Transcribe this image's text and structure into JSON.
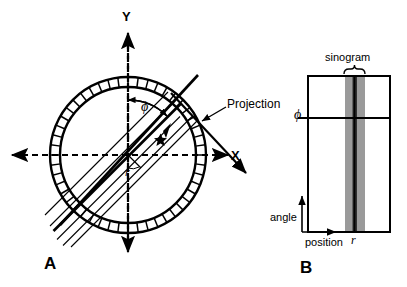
{
  "figure": {
    "background_color": "#ffffff",
    "stroke_color": "#000000",
    "width": 407,
    "height": 287
  },
  "panel_a": {
    "label": "A",
    "axis_y_label": "Y",
    "axis_x_label": "X",
    "angle_label": "ϕ",
    "radius_label": "r",
    "projection_label": "Projection",
    "detector_ring": {
      "segment_count": 48,
      "outer_radius": 78,
      "inner_radius": 68,
      "center_x": 128,
      "center_y": 155
    },
    "ray_angle_deg": 45,
    "ray_count": 5
  },
  "panel_b": {
    "label": "B",
    "sinogram_label": "sinogram",
    "angle_axis_label": "angle",
    "position_axis_label": "position",
    "angle_marker_label": "ϕ",
    "position_marker_label": "r",
    "band_light_color": "#9a9a9a",
    "band_dark_color": "#303030",
    "plot_box": {
      "x": 308,
      "y": 76,
      "width": 82,
      "height": 156
    },
    "phi_line_y": 118
  }
}
